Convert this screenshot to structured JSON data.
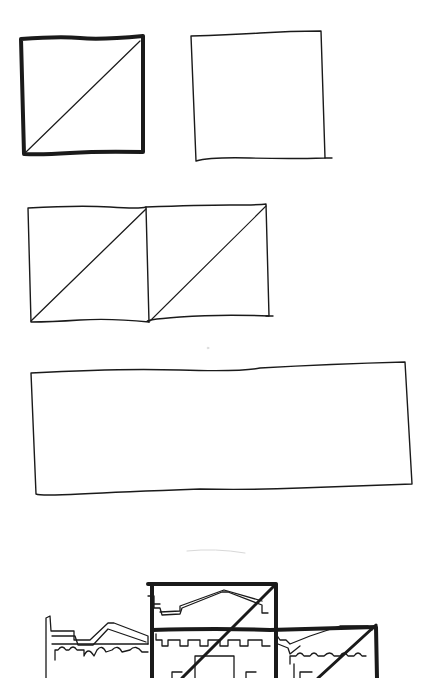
{
  "diagram": {
    "type": "hand-drawn proportion sketch",
    "ink_color": "#1a1a1a",
    "paper_color": "#ffffff",
    "figures": [
      {
        "id": "heavy-square-with-diagonal",
        "x": 22,
        "y": 38,
        "w": 122,
        "h": 116,
        "stroke": 4,
        "diagonal": true
      },
      {
        "id": "light-square",
        "x": 193,
        "y": 32,
        "w": 133,
        "h": 128,
        "stroke": 1.4,
        "diagonal": false
      },
      {
        "id": "double-square-with-diagonals",
        "x": 28,
        "y": 204,
        "w": 242,
        "h": 116,
        "stroke": 1.4,
        "cells": 2,
        "diagonal": true
      },
      {
        "id": "long-rectangle",
        "x": 32,
        "y": 364,
        "w": 378,
        "h": 130,
        "stroke": 1.4,
        "diagonal": false
      },
      {
        "id": "facade-with-regulating-squares",
        "x": 44,
        "y": 582,
        "w": 340,
        "h": 96,
        "stroke": 4
      }
    ]
  }
}
